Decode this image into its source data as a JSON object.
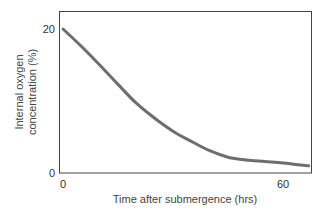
{
  "chart_data": {
    "type": "line",
    "title": "",
    "xlabel": "Time after submergence (hrs)",
    "ylabel": "Internal oxygen concentration (%)",
    "ylabel_lines": [
      "Internal oxygen",
      "concentration (%)"
    ],
    "xlim": [
      0,
      68
    ],
    "ylim": [
      0,
      20
    ],
    "x_ticks": [
      0,
      60
    ],
    "y_ticks": [
      0,
      20
    ],
    "x_tick_labels": [
      "0",
      "60"
    ],
    "y_tick_labels": [
      "0",
      "20"
    ],
    "grid": false,
    "legend": null,
    "series": [
      {
        "name": "Internal oxygen concentration",
        "color": "#6e6e6e",
        "x": [
          0,
          5,
          10,
          15,
          20,
          25,
          30,
          35,
          40,
          45,
          50,
          55,
          60,
          67
        ],
        "y": [
          20,
          17.6,
          15.0,
          12.3,
          9.7,
          7.6,
          5.8,
          4.4,
          3.1,
          2.2,
          1.8,
          1.6,
          1.4,
          1.0
        ]
      }
    ]
  },
  "colors": {
    "frame": "#444444",
    "line": "#6e6e6e",
    "text": "#333333"
  }
}
